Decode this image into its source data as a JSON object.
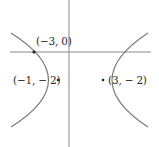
{
  "figure": {
    "type": "hyperbola-diagram",
    "colors": {
      "axis": "#8a8a8a",
      "curve": "#7a7a7a",
      "point": "#222222",
      "text": "#2a2a2a",
      "background": "#ffffff"
    },
    "axes": {
      "x_axis": {
        "x1": 10,
        "y": 52,
        "x2": 151
      },
      "y_axis": {
        "x": 69,
        "y1": 0,
        "y2": 147
      }
    },
    "curves": [
      {
        "name": "left-branch",
        "path": "M 11 33 Q 86 80 11 127"
      },
      {
        "name": "right-branch",
        "path": "M 148 33 Q 76 80 148 127"
      }
    ],
    "points": [
      {
        "name": "point-neg3-0",
        "label": "(−3, 0)",
        "cx": 34,
        "cy": 52,
        "label_x": 36,
        "label_y": 36
      },
      {
        "name": "point-neg1-neg2",
        "label": "(−1, − 2)",
        "cx": 58,
        "cy": 80,
        "label_x": 13,
        "label_y": 75
      },
      {
        "name": "point-3-neg2",
        "label": "(3, − 2)",
        "cx": 103,
        "cy": 80,
        "label_x": 108,
        "label_y": 75
      }
    ]
  }
}
